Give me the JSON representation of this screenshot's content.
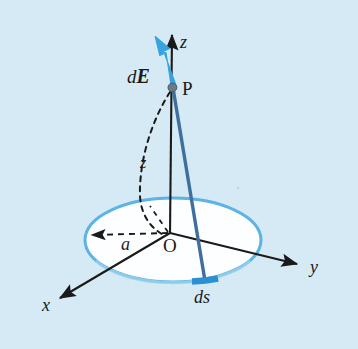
{
  "figure": {
    "kind": "physics-vector-diagram",
    "background_color": "#d5eaf4",
    "ring_fill_color": "#ffffff",
    "ring_stroke_color": "#5cb3e4",
    "accent_blue": "#35a4e0",
    "dark_blue": "#3f6f9f",
    "line_color": "#1a1a1a"
  },
  "labels": {
    "z_axis": "z",
    "y_axis": "y",
    "x_axis": "x",
    "origin": "O",
    "point_p": "P",
    "field_vector_d": "d",
    "field_vector_E": "E",
    "radius": "a",
    "height": "z",
    "arc_element": "ds"
  },
  "geometry": {
    "origin": {
      "x": 170,
      "y": 233
    },
    "point_p": {
      "x": 172,
      "y": 87
    },
    "ring_center": {
      "x": 173,
      "y": 240
    },
    "ring_rx": 88,
    "ring_ry": 42,
    "z_axis_tip": {
      "x": 172,
      "y": 31
    },
    "y_axis_tip": {
      "x": 301,
      "y": 266
    },
    "x_axis_tip": {
      "x": 57,
      "y": 301
    },
    "ds_segment": {
      "x1": 192,
      "y1": 282,
      "x2": 218,
      "y2": 279
    },
    "radius_arrow_tip": {
      "x": 88,
      "y": 235
    },
    "dE_arrow_tip": {
      "x": 155,
      "y": 37
    }
  }
}
